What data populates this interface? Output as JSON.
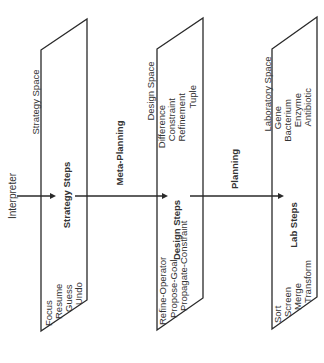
{
  "diagram": {
    "flow_labels": {
      "interpreter": "Interpreter",
      "meta_planning": "Meta-Planning",
      "planning": "Planning"
    },
    "planes": [
      {
        "space_label": "Strategy Space",
        "objects": [],
        "steps_label": "Strategy Steps",
        "operators": [
          "Focus",
          "Resume",
          "Guess",
          "Undo"
        ]
      },
      {
        "space_label": "Design Space",
        "objects": [
          "Difference",
          "Constraint",
          "Refinement",
          "Tuple"
        ],
        "steps_label": "Design Steps",
        "operators": [
          "Refine-Operator",
          "Propose-Goal",
          "Propagate-Constraint"
        ]
      },
      {
        "space_label": "Laboratory Space",
        "objects": [
          "Gene",
          "Bacterium",
          "Enzyme",
          "Antibiotic"
        ],
        "steps_label": "Lab Steps",
        "operators": [
          "Sort",
          "Screen",
          "Merge",
          "Transform"
        ]
      }
    ]
  }
}
